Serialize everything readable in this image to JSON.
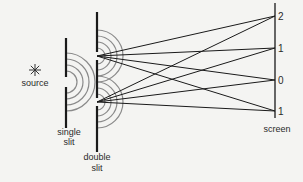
{
  "diagram": {
    "labels": {
      "source": "source",
      "single_slit_line1": "single",
      "single_slit_line2": "slit",
      "double_slit_line1": "double",
      "double_slit_line2": "slit",
      "screen": "screen"
    },
    "screen_markers": [
      {
        "label": "2",
        "y": 16
      },
      {
        "label": "1",
        "y": 48
      },
      {
        "label": "0",
        "y": 80
      },
      {
        "label": "1",
        "y": 111
      }
    ],
    "colors": {
      "line": "#1a1a1a",
      "wavefront": "#8a8a8a",
      "background": "#f4f4f2"
    },
    "icons": {
      "source": "star-burst-icon"
    },
    "source_glyph": "✳"
  }
}
